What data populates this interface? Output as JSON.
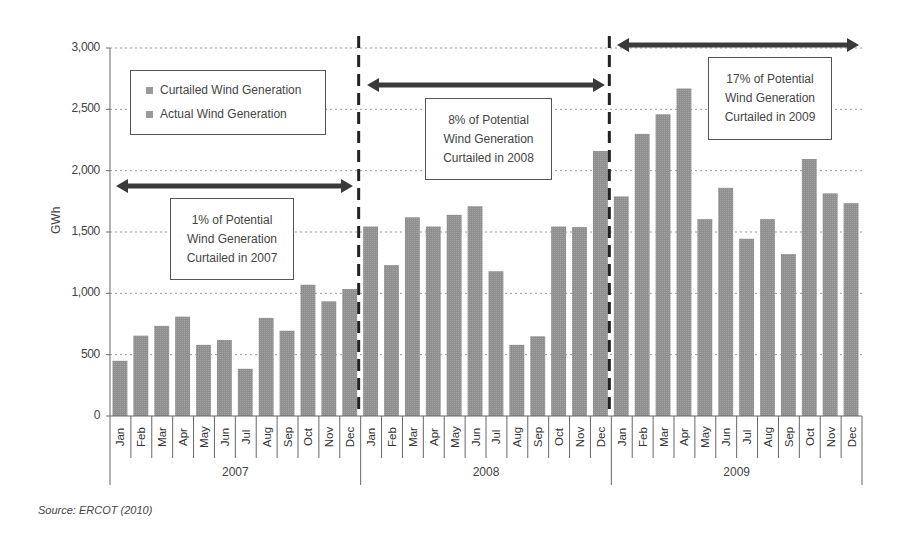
{
  "chart_data": {
    "type": "bar",
    "title": "",
    "xlabel": "",
    "ylabel": "GWh",
    "ylim": [
      0,
      3000
    ],
    "yticks": [
      0,
      500,
      1000,
      1500,
      2000,
      2500,
      3000
    ],
    "ytick_labels": [
      "0",
      "500",
      "1,000",
      "1,500",
      "2,000",
      "2,500",
      "3,000"
    ],
    "grid": "horizontal dotted",
    "legend_position": "top-left inside plot",
    "years": [
      "2007",
      "2008",
      "2009"
    ],
    "months": [
      "Jan",
      "Feb",
      "Mar",
      "Apr",
      "May",
      "Jun",
      "Jul",
      "Aug",
      "Sep",
      "Oct",
      "Nov",
      "Dec"
    ],
    "categories": [
      "Jan 2007",
      "Feb 2007",
      "Mar 2007",
      "Apr 2007",
      "May 2007",
      "Jun 2007",
      "Jul 2007",
      "Aug 2007",
      "Sep 2007",
      "Oct 2007",
      "Nov 2007",
      "Dec 2007",
      "Jan 2008",
      "Feb 2008",
      "Mar 2008",
      "Apr 2008",
      "May 2008",
      "Jun 2008",
      "Jul 2008",
      "Aug 2008",
      "Sep 2008",
      "Oct 2008",
      "Nov 2008",
      "Dec 2008",
      "Jan 2009",
      "Feb 2009",
      "Mar 2009",
      "Apr 2009",
      "May 2009",
      "Jun 2009",
      "Jul 2009",
      "Aug 2009",
      "Sep 2009",
      "Oct 2009",
      "Nov 2009",
      "Dec 2009"
    ],
    "series": [
      {
        "name": "Total (Actual + Curtailed) Wind Generation",
        "values": [
          450,
          655,
          735,
          810,
          580,
          620,
          385,
          800,
          695,
          1070,
          935,
          1035,
          1545,
          1230,
          1620,
          1545,
          1640,
          1710,
          1180,
          580,
          650,
          1545,
          1540,
          2160,
          1790,
          2300,
          2460,
          2670,
          1605,
          1860,
          1445,
          1605,
          1320,
          2095,
          1815,
          1735
        ]
      }
    ],
    "legend": [
      "Curtailed Wind Generation",
      "Actual Wind Generation"
    ],
    "annotations": [
      {
        "lines": [
          "1% of Potential",
          "Wind Generation",
          "Curtailed in 2007"
        ],
        "span": "2007"
      },
      {
        "lines": [
          "8% of Potential",
          "Wind Generation",
          "Curtailed in 2008"
        ],
        "span": "2008"
      },
      {
        "lines": [
          "17% of Potential",
          "Wind Generation",
          "Curtailed in 2009"
        ],
        "span": "2009"
      }
    ],
    "source": "Source:  ERCOT (2010)"
  },
  "colors": {
    "bar": "#8f8f8f",
    "axis": "#666666",
    "grid": "#9a9a9a",
    "arrow": "#3a3a3a",
    "divider": "#222222"
  }
}
